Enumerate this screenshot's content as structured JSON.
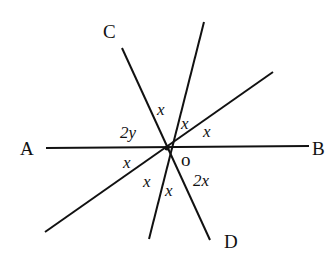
{
  "diagram": {
    "points": {
      "A": "A",
      "B": "B",
      "C": "C",
      "D": "D",
      "O": "o"
    },
    "angles": {
      "a1": "x",
      "a2": "x",
      "a3": "x",
      "a4": "2y",
      "a5": "x",
      "a6": "x",
      "a7": "x",
      "a8": "2x"
    },
    "stroke_color": "#111111"
  }
}
